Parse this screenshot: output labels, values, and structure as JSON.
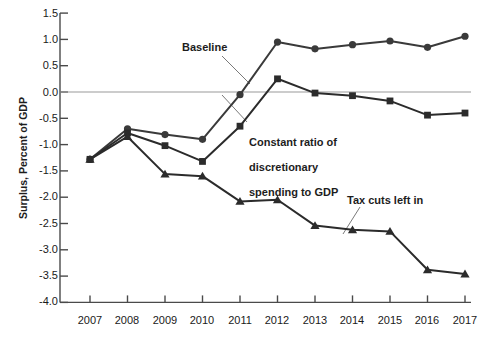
{
  "chart_data": {
    "type": "line",
    "title": "",
    "xlabel": "",
    "ylabel": "Surplus, Percent of GDP",
    "categories": [
      "2007",
      "2008",
      "2009",
      "2010",
      "2011",
      "2012",
      "2013",
      "2014",
      "2015",
      "2016",
      "2017"
    ],
    "x": [
      2007,
      2008,
      2009,
      2010,
      2011,
      2012,
      2013,
      2014,
      2015,
      2016,
      2017
    ],
    "xlim": [
      2006.4,
      2017.6
    ],
    "ylim": [
      -4.0,
      1.5
    ],
    "ytick_labels": [
      "1.5",
      "1.0",
      "0.5",
      "0.0",
      "-0.5",
      "-1.0",
      "-1.5",
      "-2.0",
      "-2.5",
      "-3.0",
      "-3.5",
      "-4.0"
    ],
    "yticks": [
      1.5,
      1.0,
      0.5,
      0.0,
      -0.5,
      -1.0,
      -1.5,
      -2.0,
      -2.5,
      -3.0,
      -3.5,
      -4.0
    ],
    "grid": false,
    "zero_line": true,
    "legend_position": "inline-annotations",
    "series": [
      {
        "name": "Baseline",
        "marker": "circle",
        "color": "#3a3a3a",
        "values": [
          -1.28,
          -0.7,
          -0.81,
          -0.9,
          -0.05,
          0.95,
          0.82,
          0.9,
          0.97,
          0.85,
          1.06
        ]
      },
      {
        "name": "Constant ratio of discretionary spending to GDP",
        "marker": "square",
        "color": "#2b2b2b",
        "values": [
          -1.28,
          -0.78,
          -1.02,
          -1.32,
          -0.65,
          0.25,
          -0.02,
          -0.07,
          -0.17,
          -0.44,
          -0.4
        ]
      },
      {
        "name": "Tax cuts left in",
        "marker": "triangle",
        "color": "#2b2b2b",
        "values": [
          -1.28,
          -0.85,
          -1.56,
          -1.6,
          -2.08,
          -2.05,
          -2.54,
          -2.62,
          -2.65,
          -3.38,
          -3.46
        ]
      }
    ],
    "annotations": [
      {
        "text": "Baseline",
        "x": 2011.0,
        "y": 0.72
      },
      {
        "text": "Constant ratio of\ndiscretionary\nspending to GDP",
        "x": 2012.0,
        "y": -0.95
      },
      {
        "text": "Tax cuts left in",
        "x": 2014.3,
        "y": -1.95
      }
    ]
  },
  "colors": {
    "axis": "#4a4a4a",
    "zero_line": "#9a9a9a",
    "series_circle": "#3a3a3a",
    "series_square": "#2b2b2b",
    "series_triangle": "#2b2b2b",
    "text": "#1a1a1a",
    "background": "#ffffff"
  },
  "labels": {
    "ylabel": "Surplus, Percent of GDP",
    "annotation_baseline": "Baseline",
    "annotation_constant_line1": "Constant ratio of",
    "annotation_constant_line2": "discretionary",
    "annotation_constant_line3": "spending to GDP",
    "annotation_taxcuts": "Tax cuts left in",
    "y_1_5": "1.5",
    "y_1_0": "1.0",
    "y_0_5": "0.5",
    "y_0_0": "0.0",
    "y_m0_5": "-0.5",
    "y_m1_0": "-1.0",
    "y_m1_5": "-1.5",
    "y_m2_0": "-2.0",
    "y_m2_5": "-2.5",
    "y_m3_0": "-3.0",
    "y_m3_5": "-3.5",
    "y_m4_0": "-4.0",
    "x_2007": "2007",
    "x_2008": "2008",
    "x_2009": "2009",
    "x_2010": "2010",
    "x_2011": "2011",
    "x_2012": "2012",
    "x_2013": "2013",
    "x_2014": "2014",
    "x_2015": "2015",
    "x_2016": "2016",
    "x_2017": "2017"
  }
}
